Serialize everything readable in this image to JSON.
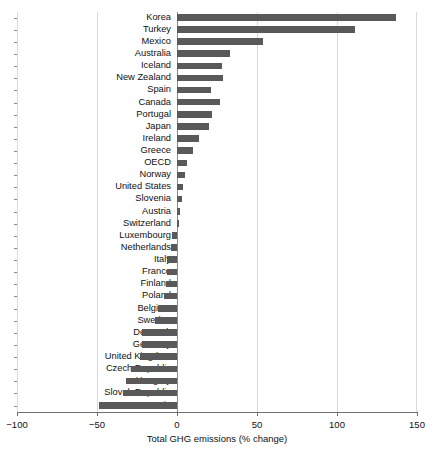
{
  "chart_data": {
    "type": "bar",
    "orientation": "horizontal",
    "title": "",
    "xlabel": "Total GHG emissions (% change)",
    "ylabel": "",
    "xlim": [
      -100,
      150
    ],
    "xticks": [
      -100,
      -50,
      0,
      50,
      100,
      150
    ],
    "xtick_labels": [
      "−100",
      "−50",
      "0",
      "50",
      "100",
      "150"
    ],
    "grid": "vertical",
    "legend": "none",
    "bar_color": "#595959",
    "categories": [
      "Korea",
      "Turkey",
      "Mexico",
      "Australia",
      "Iceland",
      "New Zealand",
      "Spain",
      "Canada",
      "Portugal",
      "Japan",
      "Ireland",
      "Greece",
      "OECD",
      "Norway",
      "United States",
      "Slovenia",
      "Austria",
      "Switzerland",
      "Luxembourg",
      "Netherlands",
      "Italy",
      "France",
      "Finland",
      "Poland",
      "Belgium",
      "Sweden",
      "Denmark",
      "Germany",
      "United Kingdom",
      "Czech Republic",
      "Hungary",
      "Slovak Republic",
      "Estonia"
    ],
    "values": [
      137,
      111,
      54,
      33,
      28,
      29,
      21,
      27,
      22,
      20,
      14,
      10,
      6,
      5,
      4,
      3,
      2,
      1,
      -3,
      -4,
      -6,
      -6,
      -7,
      -8,
      -12,
      -14,
      -22,
      -22,
      -23,
      -29,
      -32,
      -34,
      -49
    ]
  },
  "footer": {
    "smudge_text": ""
  }
}
